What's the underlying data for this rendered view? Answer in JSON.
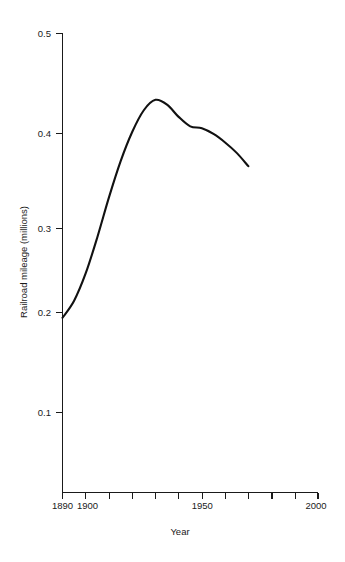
{
  "chart_data": {
    "type": "line",
    "title": "",
    "subtitle": "",
    "xlabel": "Year",
    "ylabel": "Railroad mileage (millions)",
    "xlim": [
      1890,
      2000
    ],
    "ylim": [
      0.0,
      0.5
    ],
    "grid": false,
    "legend": null,
    "legend_position": "none",
    "line_color": "#111111",
    "x_tick_values": [
      1890,
      1900,
      1910,
      1920,
      1930,
      1940,
      1950,
      1960,
      1970,
      1980,
      1990,
      2000
    ],
    "x_tick_labels_shown": [
      "1890",
      "1900",
      "1950",
      "2000"
    ],
    "x_tick_labels_shown_values": [
      1890,
      1900,
      1950,
      2000
    ],
    "y_tick_values": [
      0.1,
      0.2,
      0.3,
      0.4,
      0.5
    ],
    "y_tick_labels": [
      "0.1",
      "0.2",
      "0.3",
      "0.4",
      "0.5"
    ],
    "series": [
      {
        "name": "Railroad mileage",
        "x": [
          1890,
          1895,
          1900,
          1905,
          1910,
          1915,
          1920,
          1925,
          1930,
          1935,
          1940,
          1945,
          1950,
          1955,
          1960,
          1965,
          1970
        ],
        "values": [
          0.2,
          0.218,
          0.247,
          0.285,
          0.327,
          0.365,
          0.396,
          0.419,
          0.43,
          0.425,
          0.412,
          0.402,
          0.4,
          0.394,
          0.385,
          0.374,
          0.36
        ]
      }
    ],
    "annotations": []
  },
  "axes": {
    "y_ticks": [
      {
        "label": "0.5",
        "value": 0.5
      },
      {
        "label": "0.4",
        "value": 0.4
      },
      {
        "label": "0.3",
        "value": 0.3
      },
      {
        "label": "0.2",
        "value": 0.2
      },
      {
        "label": "0.1",
        "value": 0.1
      }
    ],
    "x_ticks": [
      {
        "label": "1890",
        "value": 1890
      },
      {
        "label": "1900",
        "value": 1900
      },
      {
        "label": "1950",
        "value": 1950
      },
      {
        "label": "2000",
        "value": 2000
      }
    ],
    "x_axis_title": "Year",
    "y_axis_title": "Railroad mileage (millions)"
  }
}
